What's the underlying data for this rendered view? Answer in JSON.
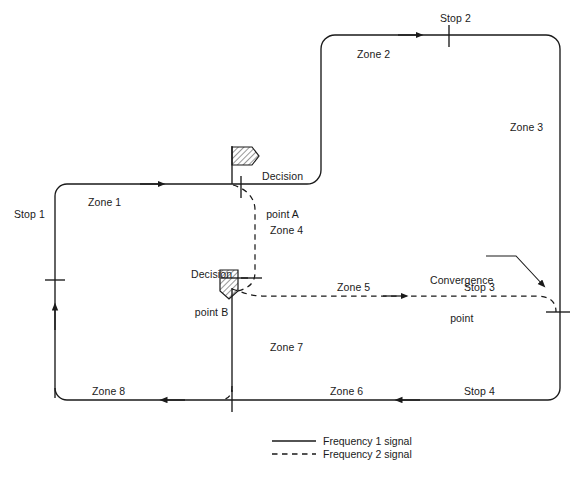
{
  "figure": {
    "type": "schematic-diagram"
  },
  "zones": [
    {
      "id": "zone1",
      "label": "Zone 1",
      "x": 88,
      "y": 196,
      "signal": "frequency-1"
    },
    {
      "id": "zone2",
      "label": "Zone 2",
      "x": 357,
      "y": 48,
      "signal": "frequency-1"
    },
    {
      "id": "zone3",
      "label": "Zone 3",
      "x": 510,
      "y": 121,
      "signal": "frequency-1"
    },
    {
      "id": "zone4",
      "label": "Zone 4",
      "x": 270,
      "y": 224,
      "signal": "frequency-2"
    },
    {
      "id": "zone5",
      "label": "Zone 5",
      "x": 337,
      "y": 281,
      "signal": "frequency-2"
    },
    {
      "id": "zone6",
      "label": "Zone 6",
      "x": 330,
      "y": 385,
      "signal": "frequency-1"
    },
    {
      "id": "zone7",
      "label": "Zone 7",
      "x": 270,
      "y": 341,
      "signal": "frequency-1"
    },
    {
      "id": "zone8",
      "label": "Zone 8",
      "x": 92,
      "y": 385,
      "signal": "frequency-1"
    }
  ],
  "stops": [
    {
      "id": "stop1",
      "label": "Stop 1",
      "x": 14,
      "y": 208
    },
    {
      "id": "stop2",
      "label": "Stop 2",
      "x": 440,
      "y": 12
    },
    {
      "id": "stop3",
      "label": "Stop 3",
      "x": 464,
      "y": 281
    },
    {
      "id": "stop4",
      "label": "Stop 4",
      "x": 464,
      "y": 385
    }
  ],
  "decision_points": [
    {
      "id": "decision-point-a",
      "line1": "Decision",
      "line2": "point A",
      "x": 262,
      "y": 145
    },
    {
      "id": "decision-point-b",
      "line1": "Decision",
      "line2": "point B",
      "x": 191,
      "y": 243
    }
  ],
  "annotations": [
    {
      "id": "convergence-point",
      "line1": "Convergence",
      "line2": "point",
      "x": 430,
      "y": 249
    }
  ],
  "legend": {
    "items": [
      {
        "id": "frequency-1",
        "label": "Frequency 1 signal",
        "style": "solid"
      },
      {
        "id": "frequency-2",
        "label": "Frequency 2 signal",
        "style": "dashed"
      }
    ]
  },
  "colors": {
    "line": "#1a1a1a",
    "text": "#1a1a1a",
    "background": "#ffffff",
    "hatch": "#1a1a1a"
  }
}
